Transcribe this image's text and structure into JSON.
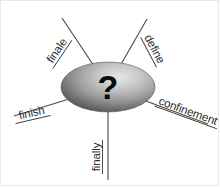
{
  "diagram": {
    "type": "radial-spider-diagram",
    "center": {
      "symbol": "?",
      "shape": "ellipse",
      "fill_light": "#e2e2e2",
      "fill_mid": "#9a9a9a",
      "fill_dark": "#4f4f4f"
    },
    "line_color": "#4a4a4a",
    "text_color": "#2e2e2e",
    "background": "#ffffff",
    "nodes": [
      {
        "id": "finale",
        "label": "finale",
        "position": "upper-left",
        "angle_deg": -56
      },
      {
        "id": "define",
        "label": "define",
        "position": "upper-right",
        "angle_deg": 62
      },
      {
        "id": "confinement",
        "label": "confinement",
        "position": "right",
        "angle_deg": 20
      },
      {
        "id": "finally",
        "label": "finally",
        "position": "bottom",
        "angle_deg": 90
      },
      {
        "id": "finish",
        "label": "finish",
        "position": "left",
        "angle_deg": -13
      }
    ]
  }
}
